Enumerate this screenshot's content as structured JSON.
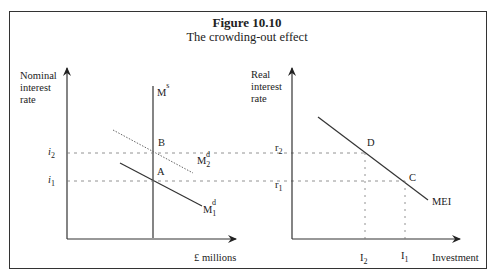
{
  "figure": {
    "title": "Figure 10.10",
    "subtitle": "The crowding-out effect"
  },
  "left_panel": {
    "y_label_line1": "Nominal",
    "y_label_line2": "interest",
    "y_label_line3": "rate",
    "x_label": "£ millions",
    "money_supply_label": "M",
    "money_supply_sup": "s",
    "md1_label": "M",
    "md1_sub": "1",
    "md1_sup": "d",
    "md2_label": "M",
    "md2_sub": "2",
    "md2_sup": "d",
    "point_a": "A",
    "point_b": "B",
    "i1_label": "i",
    "i1_sub": "1",
    "i2_label": "i",
    "i2_sub": "2"
  },
  "right_panel": {
    "y_label_line1": "Real",
    "y_label_line2": "interest",
    "y_label_line3": "rate",
    "x_label": "Investment",
    "curve_label": "MEI",
    "point_c": "C",
    "point_d": "D",
    "r1_label": "r",
    "r1_sub": "1",
    "r2_label": "r",
    "r2_sub": "2",
    "I1_label": "I",
    "I1_sub": "1",
    "I2_label": "I",
    "I2_sub": "2"
  },
  "colors": {
    "line": "#333333",
    "dashed": "#777777",
    "md2_dotted": "#666666"
  }
}
